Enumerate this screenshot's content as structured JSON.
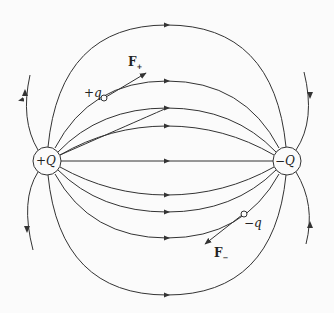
{
  "diagram": {
    "charges": [
      {
        "label": "+Q",
        "x": 47,
        "y": 161,
        "r": 14
      },
      {
        "label": "−Q",
        "x": 287,
        "y": 161,
        "r": 14
      }
    ],
    "test_charges": [
      {
        "label": "+q",
        "x": 104,
        "y": 98
      },
      {
        "label": "−q",
        "x": 244,
        "y": 214
      }
    ],
    "forces": [
      {
        "label": "F",
        "subscript": "+",
        "from": [
          104,
          98
        ],
        "to": [
          146,
          73
        ]
      },
      {
        "label": "F",
        "subscript": "−",
        "from": [
          244,
          214
        ],
        "to": [
          205,
          244
        ]
      }
    ],
    "line_color": "#333333",
    "arrow_ys": [
      25,
      81,
      108,
      126,
      161,
      195,
      212,
      238,
      295
    ]
  }
}
